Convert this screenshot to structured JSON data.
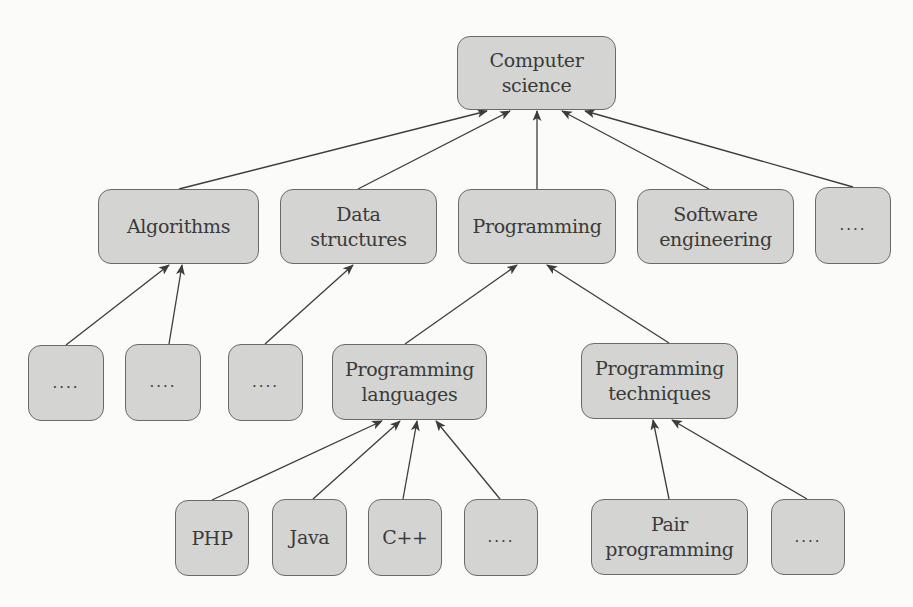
{
  "diagram": {
    "colors": {
      "node_fill": "#d4d4d2",
      "node_border": "#6a6a68",
      "edge": "#3c3c3a",
      "text": "#3a3a38",
      "background": "#fbfbfa"
    },
    "nodes": [
      {
        "id": "computer-science",
        "label": "Computer\nscience",
        "x": 457,
        "y": 36,
        "w": 159,
        "h": 74
      },
      {
        "id": "algorithms",
        "label": "Algorithms",
        "x": 98,
        "y": 189,
        "w": 161,
        "h": 75
      },
      {
        "id": "data-structures",
        "label": "Data\nstructures",
        "x": 280,
        "y": 189,
        "w": 157,
        "h": 75
      },
      {
        "id": "programming",
        "label": "Programming",
        "x": 458,
        "y": 189,
        "w": 158,
        "h": 75
      },
      {
        "id": "software-engineering",
        "label": "Software\nengineering",
        "x": 637,
        "y": 189,
        "w": 157,
        "h": 75
      },
      {
        "id": "cs-more",
        "label": "....",
        "x": 815,
        "y": 187,
        "w": 76,
        "h": 77
      },
      {
        "id": "algorithms-more-1",
        "label": "....",
        "x": 28,
        "y": 345,
        "w": 76,
        "h": 76
      },
      {
        "id": "algorithms-more-2",
        "label": "....",
        "x": 125,
        "y": 344,
        "w": 76,
        "h": 77
      },
      {
        "id": "data-structures-more",
        "label": "....",
        "x": 228,
        "y": 344,
        "w": 75,
        "h": 77
      },
      {
        "id": "programming-languages",
        "label": "Programming\nlanguages",
        "x": 332,
        "y": 344,
        "w": 155,
        "h": 76
      },
      {
        "id": "programming-techniques",
        "label": "Programming\ntechniques",
        "x": 581,
        "y": 343,
        "w": 157,
        "h": 76
      },
      {
        "id": "php",
        "label": "PHP",
        "x": 175,
        "y": 500,
        "w": 74,
        "h": 76
      },
      {
        "id": "java",
        "label": "Java",
        "x": 272,
        "y": 499,
        "w": 75,
        "h": 77
      },
      {
        "id": "cpp",
        "label": "C++",
        "x": 368,
        "y": 499,
        "w": 74,
        "h": 77
      },
      {
        "id": "languages-more",
        "label": "....",
        "x": 464,
        "y": 499,
        "w": 74,
        "h": 77
      },
      {
        "id": "pair-programming",
        "label": "Pair\nprogramming",
        "x": 591,
        "y": 499,
        "w": 157,
        "h": 76
      },
      {
        "id": "techniques-more",
        "label": "....",
        "x": 771,
        "y": 499,
        "w": 74,
        "h": 76
      }
    ],
    "edges": [
      {
        "from": "algorithms",
        "to": "computer-science",
        "x1": 179,
        "y1": 189,
        "x2": 487,
        "y2": 111
      },
      {
        "from": "data-structures",
        "to": "computer-science",
        "x1": 358,
        "y1": 189,
        "x2": 510,
        "y2": 111
      },
      {
        "from": "programming",
        "to": "computer-science",
        "x1": 537,
        "y1": 189,
        "x2": 537,
        "y2": 111
      },
      {
        "from": "software-engineering",
        "to": "computer-science",
        "x1": 709,
        "y1": 189,
        "x2": 562,
        "y2": 111
      },
      {
        "from": "cs-more",
        "to": "computer-science",
        "x1": 853,
        "y1": 187,
        "x2": 585,
        "y2": 111
      },
      {
        "from": "algorithms-more-1",
        "to": "algorithms",
        "x1": 66,
        "y1": 345,
        "x2": 169,
        "y2": 265
      },
      {
        "from": "algorithms-more-2",
        "to": "algorithms",
        "x1": 169,
        "y1": 344,
        "x2": 182,
        "y2": 265
      },
      {
        "from": "data-structures-more",
        "to": "data-structures",
        "x1": 265,
        "y1": 344,
        "x2": 353,
        "y2": 265
      },
      {
        "from": "programming-languages",
        "to": "programming",
        "x1": 405,
        "y1": 344,
        "x2": 517,
        "y2": 265
      },
      {
        "from": "programming-techniques",
        "to": "programming",
        "x1": 669,
        "y1": 343,
        "x2": 547,
        "y2": 265
      },
      {
        "from": "php",
        "to": "programming-languages",
        "x1": 212,
        "y1": 500,
        "x2": 382,
        "y2": 421
      },
      {
        "from": "java",
        "to": "programming-languages",
        "x1": 313,
        "y1": 499,
        "x2": 400,
        "y2": 421
      },
      {
        "from": "cpp",
        "to": "programming-languages",
        "x1": 403,
        "y1": 499,
        "x2": 417,
        "y2": 421
      },
      {
        "from": "languages-more",
        "to": "programming-languages",
        "x1": 500,
        "y1": 499,
        "x2": 436,
        "y2": 421
      },
      {
        "from": "pair-programming",
        "to": "programming-techniques",
        "x1": 669,
        "y1": 499,
        "x2": 653,
        "y2": 420
      },
      {
        "from": "techniques-more",
        "to": "programming-techniques",
        "x1": 807,
        "y1": 499,
        "x2": 672,
        "y2": 420
      }
    ]
  }
}
